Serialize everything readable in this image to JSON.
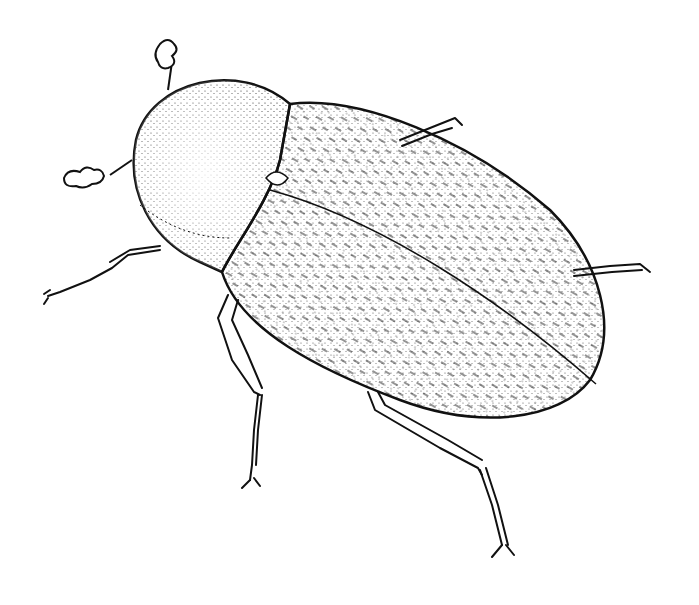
{
  "image": {
    "subject": "beetle",
    "style": "pen-and-ink stipple illustration",
    "colors": {
      "ink": "#111111",
      "paper": "#ffffff"
    }
  }
}
